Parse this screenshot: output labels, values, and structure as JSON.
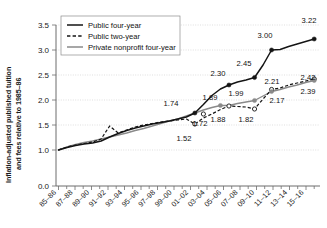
{
  "chart_data": {
    "type": "line",
    "title": "",
    "xlabel": "",
    "ylabel": "Inflation-adjusted published tuition and fees relative to 1985–86",
    "ylim": [
      0.0,
      3.5
    ],
    "yticks": [
      "0.0",
      "1.0",
      "1.5",
      "2.0",
      "2.5",
      "3.0",
      "3.5"
    ],
    "ytick_values": [
      0.0,
      1.0,
      1.5,
      2.0,
      2.5,
      3.0,
      3.5
    ],
    "y_axis_break": true,
    "grid": "horizontal-dotted",
    "legend_position": "top-left",
    "categories": [
      "85–86",
      "86–87",
      "87–88",
      "88–89",
      "89–90",
      "90–91",
      "91–92",
      "92–93",
      "93–94",
      "94–95",
      "95–96",
      "96–97",
      "97–98",
      "98–99",
      "99–00",
      "00–01",
      "01–02",
      "02–03",
      "03–04",
      "04–05",
      "05–06",
      "06–07",
      "07–08",
      "08–09",
      "09–10",
      "10–11",
      "11–12",
      "12–13",
      "13–14",
      "14–15",
      "15–16"
    ],
    "xtick_labels": [
      "85–86",
      "87–88",
      "89–90",
      "91–92",
      "93–94",
      "95–96",
      "97–98",
      "99–00",
      "01–02",
      "03–04",
      "05–06",
      "07–08",
      "09–10",
      "11–12",
      "13–14",
      "15–16"
    ],
    "series": [
      {
        "name": "Public four-year",
        "style": "solid",
        "color": "#141414",
        "values": [
          1.0,
          1.05,
          1.09,
          1.12,
          1.14,
          1.18,
          1.26,
          1.33,
          1.39,
          1.44,
          1.48,
          1.52,
          1.55,
          1.58,
          1.62,
          1.66,
          1.74,
          1.91,
          2.09,
          2.22,
          2.3,
          2.36,
          2.4,
          2.45,
          2.7,
          3.0,
          3.01,
          3.07,
          3.12,
          3.17,
          3.22
        ]
      },
      {
        "name": "Public two-year",
        "style": "dashed",
        "color": "#141414",
        "values": [
          1.0,
          1.06,
          1.1,
          1.13,
          1.16,
          1.22,
          1.48,
          1.34,
          1.4,
          1.46,
          1.5,
          1.53,
          1.56,
          1.58,
          1.6,
          1.62,
          1.52,
          1.64,
          1.72,
          1.81,
          1.88,
          1.87,
          1.86,
          1.82,
          2.02,
          2.21,
          2.24,
          2.3,
          2.34,
          2.38,
          2.42
        ]
      },
      {
        "name": "Private nonprofit four-year",
        "style": "solid",
        "color": "#8a8a8a",
        "values": [
          1.0,
          1.06,
          1.11,
          1.15,
          1.18,
          1.22,
          1.26,
          1.3,
          1.34,
          1.39,
          1.43,
          1.48,
          1.53,
          1.58,
          1.62,
          1.68,
          1.74,
          1.8,
          1.85,
          1.89,
          1.89,
          1.93,
          1.96,
          1.99,
          2.08,
          2.17,
          2.21,
          2.26,
          2.3,
          2.35,
          2.39
        ]
      }
    ],
    "annotations": [
      {
        "label": "1.74",
        "series": "Public four-year",
        "category": "01–02",
        "value": 1.74
      },
      {
        "label": "2.30",
        "series": "Public four-year",
        "category": "05–06",
        "value": 2.3
      },
      {
        "label": "2.45",
        "series": "Public four-year",
        "category": "08–09",
        "value": 2.45
      },
      {
        "label": "3.00",
        "series": "Public four-year",
        "category": "10–11",
        "value": 3.0
      },
      {
        "label": "3.22",
        "series": "Public four-year",
        "category": "15–16",
        "value": 3.22
      },
      {
        "label": "1.52",
        "series": "Public two-year",
        "category": "01–02",
        "value": 1.52
      },
      {
        "label": "1.72",
        "series": "Public two-year",
        "category": "02–03",
        "value": 1.72
      },
      {
        "label": "1.88",
        "series": "Public two-year",
        "category": "05–06",
        "value": 1.88
      },
      {
        "label": "1.82",
        "series": "Public two-year",
        "category": "08–09",
        "value": 1.82
      },
      {
        "label": "2.21",
        "series": "Public two-year",
        "category": "10–11",
        "value": 2.21
      },
      {
        "label": "2.42",
        "series": "Public two-year",
        "category": "15–16",
        "value": 2.42
      },
      {
        "label": "1.89",
        "series": "Private nonprofit four-year",
        "category": "04–05",
        "value": 1.89
      },
      {
        "label": "1.99",
        "series": "Private nonprofit four-year",
        "category": "08–09",
        "value": 1.99
      },
      {
        "label": "2.17",
        "series": "Private nonprofit four-year",
        "category": "10–11",
        "value": 2.17
      },
      {
        "label": "2.39",
        "series": "Private nonprofit four-year",
        "category": "15–16",
        "value": 2.39
      }
    ]
  },
  "legend": {
    "items": [
      {
        "label": "Public four-year"
      },
      {
        "label": "Public two-year"
      },
      {
        "label": "Private nonprofit four-year"
      }
    ]
  },
  "axes": {
    "y_label": "Inflation-adjusted published tuition and fees relative to 1985–86",
    "y_ticks": [
      "3.5",
      "3.0",
      "2.5",
      "2.0",
      "1.5",
      "1.0",
      "0.0"
    ],
    "x_ticks": [
      "85–86",
      "87–88",
      "89–90",
      "91–92",
      "93–94",
      "95–96",
      "97–98",
      "99–00",
      "01–02",
      "03–04",
      "05–06",
      "07–08",
      "09–10",
      "11–12",
      "13–14",
      "15–16"
    ]
  },
  "labels": {
    "l_1_74": "1.74",
    "l_2_30": "2.30",
    "l_2_45": "2.45",
    "l_3_00": "3.00",
    "l_3_22": "3.22",
    "l_1_52": "1.52",
    "l_1_72": "1.72",
    "l_1_88": "1.88",
    "l_1_82": "1.82",
    "l_2_21": "2.21",
    "l_2_42": "2.42",
    "l_1_89": "1.89",
    "l_1_99": "1.99",
    "l_2_17": "2.17",
    "l_2_39": "2.39"
  },
  "colors": {
    "public_four_year": "#141414",
    "public_two_year": "#141414",
    "private_nonprofit": "#8a8a8a",
    "grid": "#c9c9c9",
    "axis": "#6d6d6d",
    "background": "#ffffff"
  }
}
